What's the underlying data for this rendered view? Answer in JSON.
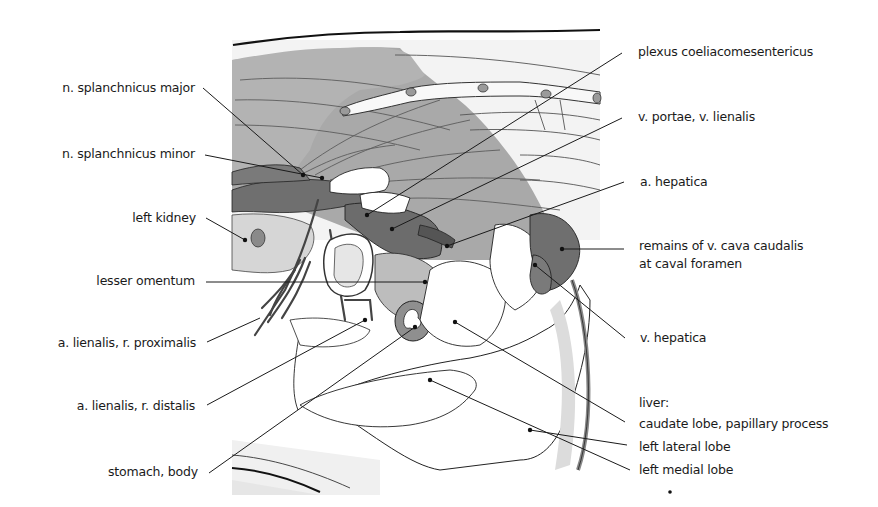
{
  "figure": {
    "colors": {
      "background": "#ffffff",
      "panel": "#ececec",
      "muscle": "#a8a8a8",
      "vessel_dark": "#6e6e6e",
      "vessel_mid": "#8c8c8c",
      "organ_light": "#ffffff",
      "line": "#1e1e1e"
    }
  },
  "labels_left": [
    {
      "id": "n-splanchnicus-major",
      "text": "n. splanchnicus major"
    },
    {
      "id": "n-splanchnicus-minor",
      "text": "n. splanchnicus minor"
    },
    {
      "id": "left-kidney",
      "text": "left kidney"
    },
    {
      "id": "lesser-omentum",
      "text": "lesser omentum"
    },
    {
      "id": "a-lienalis-r-proximalis",
      "text": "a. lienalis, r. proximalis"
    },
    {
      "id": "a-lienalis-r-distalis",
      "text": "a. lienalis, r. distalis"
    },
    {
      "id": "stomach-body",
      "text": "stomach, body"
    }
  ],
  "labels_right": [
    {
      "id": "plexus-coeliacomesentericus",
      "text": "plexus coeliacomesentericus"
    },
    {
      "id": "v-portae-v-lienalis",
      "text": "v. portae, v. lienalis"
    },
    {
      "id": "a-hepatica",
      "text": "a. hepatica"
    },
    {
      "id": "remains-v-cava-caudalis",
      "text": "remains of v. cava caudalis"
    },
    {
      "id": "at-caval-foramen",
      "text": "at caval foramen"
    },
    {
      "id": "v-hepatica",
      "text": "v. hepatica"
    },
    {
      "id": "liver",
      "text": "liver:"
    },
    {
      "id": "caudate-lobe",
      "text": "caudate lobe, papillary process"
    },
    {
      "id": "left-lateral-lobe",
      "text": "left lateral lobe"
    },
    {
      "id": "left-medial-lobe",
      "text": "left medial lobe"
    }
  ]
}
